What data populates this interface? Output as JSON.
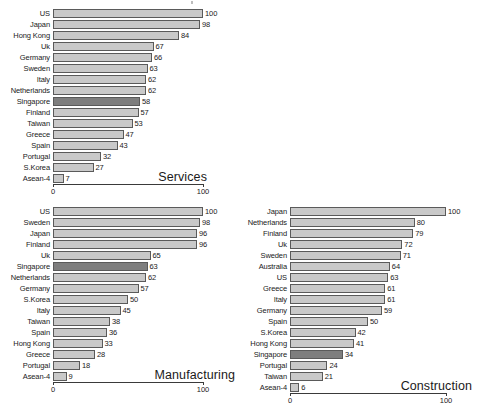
{
  "page": {
    "background_color": "#ffffff",
    "bar_color": "#c9c9c9",
    "highlight_color": "#7e7e7e",
    "bar_border_color": "#5a5a5a",
    "axis_color": "#3a3a3a",
    "highlighted_category": "Singapore"
  },
  "chart_data": [
    {
      "id": "services",
      "type": "bar",
      "orientation": "horizontal",
      "title": "Services",
      "xlabel": "",
      "ylabel": "",
      "xlim": [
        0,
        100
      ],
      "grid": false,
      "legend": "none",
      "tick_labels": [
        "0",
        "100"
      ],
      "ticks": [
        0,
        100
      ],
      "highlight": [
        "Singapore"
      ],
      "categories": [
        "US",
        "Japan",
        "Hong Kong",
        "Uk",
        "Germany",
        "Sweden",
        "Italy",
        "Netherlands",
        "Singapore",
        "Finland",
        "Taiwan",
        "Greece",
        "Spain",
        "Portugal",
        "S.Korea",
        "Asean-4"
      ],
      "values": [
        100,
        98,
        84,
        67,
        66,
        63,
        62,
        62,
        58,
        57,
        53,
        47,
        43,
        32,
        27,
        7
      ]
    },
    {
      "id": "manufacturing",
      "type": "bar",
      "orientation": "horizontal",
      "title": "Manufacturing",
      "xlabel": "",
      "ylabel": "",
      "xlim": [
        0,
        100
      ],
      "grid": false,
      "legend": "none",
      "tick_labels": [
        "0",
        "100"
      ],
      "ticks": [
        0,
        100
      ],
      "highlight": [
        "Singapore"
      ],
      "categories": [
        "US",
        "Sweden",
        "Japan",
        "Finland",
        "Uk",
        "Singapore",
        "Netherlands",
        "Germany",
        "S.Korea",
        "Italy",
        "Taiwan",
        "Spain",
        "Hong Kong",
        "Greece",
        "Portugal",
        "Asean-4"
      ],
      "values": [
        100,
        98,
        96,
        96,
        65,
        63,
        62,
        57,
        50,
        45,
        38,
        36,
        33,
        28,
        18,
        9
      ]
    },
    {
      "id": "construction",
      "type": "bar",
      "orientation": "horizontal",
      "title": "Construction",
      "xlabel": "",
      "ylabel": "",
      "xlim": [
        0,
        100
      ],
      "grid": false,
      "legend": "none",
      "tick_labels": [
        "0",
        "100"
      ],
      "ticks": [
        0,
        100
      ],
      "highlight": [
        "Singapore"
      ],
      "categories": [
        "Japan",
        "Netherlands",
        "Finland",
        "Uk",
        "Sweden",
        "Australia",
        "US",
        "Greece",
        "Italy",
        "Germany",
        "Spain",
        "S.Korea",
        "Hong Kong",
        "Singapore",
        "Portugal",
        "Taiwan",
        "Asean-4"
      ],
      "values": [
        100,
        80,
        79,
        72,
        71,
        64,
        63,
        61,
        61,
        59,
        50,
        42,
        41,
        34,
        24,
        21,
        6
      ]
    }
  ]
}
